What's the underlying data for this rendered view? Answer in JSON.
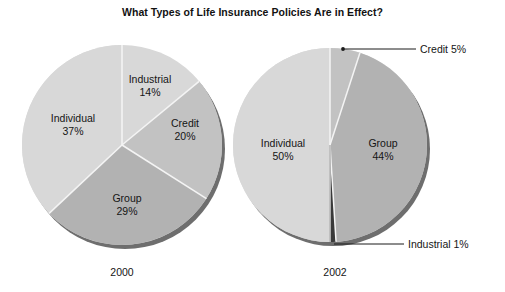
{
  "chart_data": {
    "type": "pie",
    "title": "What Types of Life Insurance Policies Are in Effect?",
    "xlabel": "",
    "ylabel": "",
    "legend_position": "none",
    "grid": false,
    "charts": [
      {
        "year": "2000",
        "slices": [
          {
            "label": "Industrial",
            "pct_text": "14%",
            "value": 14,
            "color": "#8c8c8c"
          },
          {
            "label": "Credit",
            "pct_text": "20%",
            "value": 20,
            "color": "#c2c2c2"
          },
          {
            "label": "Group",
            "pct_text": "29%",
            "value": 29,
            "color": "#b2b2b2"
          },
          {
            "label": "Individual",
            "pct_text": "37%",
            "value": 37,
            "color": "#d8d8d8"
          }
        ]
      },
      {
        "year": "2002",
        "slices": [
          {
            "label": "Credit",
            "pct_text": "5%",
            "value": 5,
            "color": "#c2c2c2"
          },
          {
            "label": "Group",
            "pct_text": "44%",
            "value": 44,
            "color": "#b2b2b2"
          },
          {
            "label": "Industrial",
            "pct_text": "1%",
            "value": 1,
            "color": "#3a3a3a"
          },
          {
            "label": "Individual",
            "pct_text": "50%",
            "value": 50,
            "color": "#d8d8d8"
          }
        ]
      }
    ]
  },
  "labels": {
    "pie2000": {
      "industrial_name": "Industrial",
      "industrial_pct": "14%",
      "credit_name": "Credit",
      "credit_pct": "20%",
      "group_name": "Group",
      "group_pct": "29%",
      "individual_name": "Individual",
      "individual_pct": "37%"
    },
    "pie2002": {
      "individual_name": "Individual",
      "individual_pct": "50%",
      "group_name": "Group",
      "group_pct": "44%",
      "credit_callout": "Credit 5%",
      "industrial_callout": "Industrial 1%"
    },
    "year_2000": "2000",
    "year_2002": "2002"
  },
  "colors": {
    "background": "#ffffff",
    "text": "#151515",
    "lightest": "#d8d8d8",
    "light": "#c2c2c2",
    "medium": "#b2b2b2",
    "dark": "#8c8c8c",
    "darkest": "#3a3a3a",
    "shadow": "#6e6e6e",
    "divider": "#f2f2f2"
  }
}
